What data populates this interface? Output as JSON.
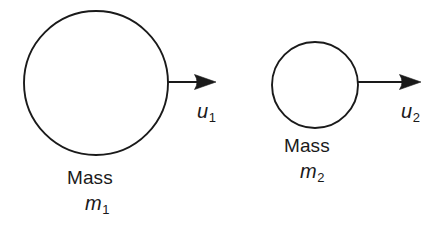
{
  "figure": {
    "background_color": "#ffffff",
    "stroke_color": "#1a1a1a",
    "text_color": "#1a1a1a"
  },
  "bodies": [
    {
      "id": "body-1",
      "shape": "circle",
      "mass_label": "Mass",
      "mass_symbol": "m",
      "mass_subscript": "1",
      "velocity_symbol": "u",
      "velocity_subscript": "1",
      "arrow_direction": "right",
      "center_x": 96,
      "center_y": 83,
      "radius": 72,
      "arrow_start_x": 169,
      "arrow_end_x": 216,
      "arrow_y": 82
    },
    {
      "id": "body-2",
      "shape": "circle",
      "mass_label": "Mass",
      "mass_symbol": "m",
      "mass_subscript": "2",
      "velocity_symbol": "u",
      "velocity_subscript": "2",
      "arrow_direction": "right",
      "center_x": 315,
      "center_y": 85,
      "radius": 43,
      "arrow_start_x": 358,
      "arrow_end_x": 421,
      "arrow_y": 82
    }
  ],
  "labels": {
    "mass1_text": "Mass",
    "mass1_symbol": "m",
    "mass1_subscript": "1",
    "velocity1_symbol": "u",
    "velocity1_subscript": "1",
    "mass2_text": "Mass",
    "mass2_symbol": "m",
    "mass2_subscript": "2",
    "velocity2_symbol": "u",
    "velocity2_subscript": "2"
  }
}
